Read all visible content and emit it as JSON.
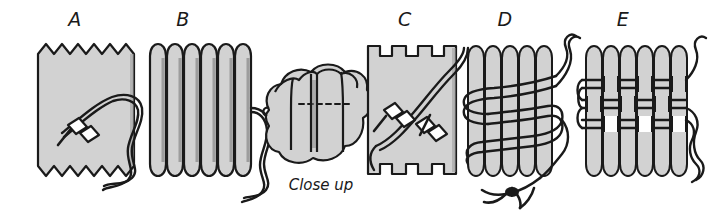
{
  "figure": {
    "background_color": "#ffffff",
    "fabric_fill_color": "#d2d2d2",
    "fabric_shade_color": "#b4b4b4",
    "outline_color": "#1a1a1a",
    "thread_color": "#1a1a1a",
    "needle_fill_color": "#ffffff"
  },
  "panels": [
    {
      "id": "a",
      "label": "A",
      "description": "Flat fabric rectangle with pinked zigzag top and bottom edges, threaded needle passing through running stitch",
      "label_x": 75,
      "label_y": 8,
      "x": 38,
      "y": 44,
      "width": 100,
      "height": 132
    },
    {
      "id": "b",
      "label": "B",
      "description": "Fabric gathered into six vertical pleats with thread tail hanging at right",
      "label_x": 182,
      "label_y": 8,
      "x": 148,
      "y": 44,
      "width": 100,
      "height": 132
    },
    {
      "id": "closeup",
      "label": "Close up",
      "description": "Magnified detail of two adjacent pleats showing dashed stitch line running through the fold",
      "label_x": 282,
      "label_y": 180,
      "x": 262,
      "y": 68,
      "width": 110,
      "height": 105
    },
    {
      "id": "c",
      "label": "C",
      "description": "Fabric with square tab edges and two threaded needles crossing diagonally through the layers",
      "label_x": 403,
      "label_y": 8,
      "x": 368,
      "y": 44,
      "width": 88,
      "height": 132
    },
    {
      "id": "d",
      "label": "D",
      "description": "Pleated fabric with thread wound around the bundle several times, knotted at the lower edge",
      "label_x": 502,
      "label_y": 8,
      "x": 466,
      "y": 48,
      "width": 96,
      "height": 128
    },
    {
      "id": "e",
      "label": "E",
      "description": "Pleated fabric with rows of thread woven horizontally across the pleats forming a banded smocking pattern",
      "label_x": 620,
      "label_y": 8,
      "x": 584,
      "y": 48,
      "width": 96,
      "height": 128
    }
  ],
  "caption": {
    "close_up_label": "Close up"
  }
}
